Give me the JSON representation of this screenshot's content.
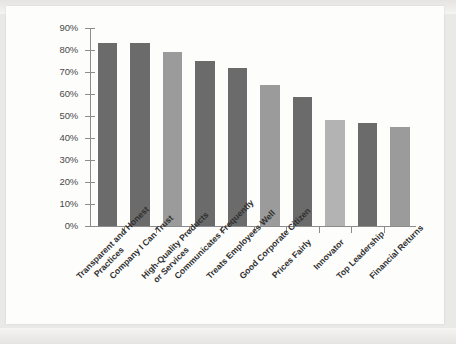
{
  "chart_data": {
    "type": "bar",
    "title": "",
    "subtitle": "",
    "xlabel": "",
    "ylabel": "",
    "ylim": [
      0,
      90
    ],
    "ytick_values": [
      0,
      10,
      20,
      30,
      40,
      50,
      60,
      70,
      80,
      90
    ],
    "ytick_labels": [
      "0%",
      "10%",
      "20%",
      "30%",
      "40%",
      "50%",
      "60%",
      "70%",
      "80%",
      "90%"
    ],
    "grid": false,
    "legend": "none",
    "categories": [
      "Transparent and Honest Practices",
      "Company I Can Trust",
      "High-Quality Products or Services",
      "Communicates Frequently",
      "Treats Employees Well",
      "Good Corporate Citizen",
      "Prices Fairly",
      "Innovator",
      "Top Leadership",
      "Financial Returns"
    ],
    "category_lines": [
      [
        "Transparent and Honest",
        "Practices"
      ],
      [
        "Company I Can Trust"
      ],
      [
        "High-Quality Products",
        "or Services"
      ],
      [
        "Communicates Frequently"
      ],
      [
        "Treats Employees Well"
      ],
      [
        "Good Corporate Citizen"
      ],
      [
        "Prices Fairly"
      ],
      [
        "Innovator"
      ],
      [
        "Top Leadership"
      ],
      [
        "Financial Returns"
      ]
    ],
    "values": [
      83,
      83,
      79,
      75,
      72,
      64,
      58.5,
      48,
      47,
      45
    ],
    "bar_colors": [
      "#6b6b6b",
      "#6b6b6b",
      "#9b9b9b",
      "#6b6b6b",
      "#6b6b6b",
      "#9b9b9b",
      "#6b6b6b",
      "#b3b3b3",
      "#6b6b6b",
      "#9b9b9b"
    ],
    "axis_color": "#8c8c8c",
    "background_color": "#fdfdfc"
  }
}
